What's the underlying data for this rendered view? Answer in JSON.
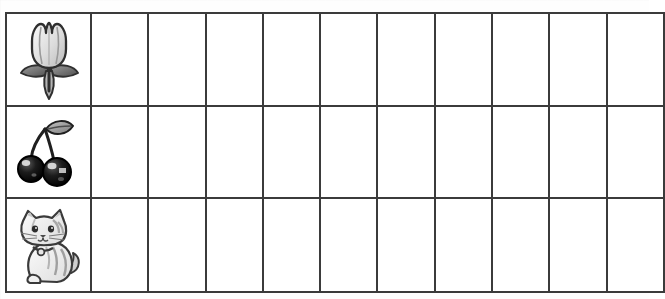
{
  "document": {
    "type": "worksheet-grid",
    "title": "Picture graph worksheet grid",
    "description": "Three-row table; first column holds a picture, remaining cells are blank.",
    "background_color": "#fefefe",
    "line_color": "#3b3b3b"
  },
  "grid": {
    "rows": 3,
    "columns": 11,
    "blank_columns": 10,
    "rows_data": [
      {
        "index": 1,
        "icon_name": "tulip-icon",
        "icon_label": "Tulip",
        "icon_colors": {
          "bloom": "#d9d9d9",
          "outline": "#2f2f2f",
          "leaf": "#8a8a8a",
          "leaf_dark": "#4a4a4a",
          "stem": "#7a7a7a"
        },
        "cells": [
          "",
          "",
          "",
          "",
          "",
          "",
          "",
          "",
          "",
          ""
        ]
      },
      {
        "index": 2,
        "icon_name": "cherries-icon",
        "icon_label": "Cherries",
        "icon_colors": {
          "fruit": "#141414",
          "highlight": "#e8e8e8",
          "outline": "#000000",
          "leaf": "#9a9a9a",
          "stem": "#2a2a2a"
        },
        "cells": [
          "",
          "",
          "",
          "",
          "",
          "",
          "",
          "",
          "",
          ""
        ]
      },
      {
        "index": 3,
        "icon_name": "cat-icon",
        "icon_label": "Cat",
        "icon_colors": {
          "body": "#f2f2f2",
          "stripes": "#9e9e9e",
          "outline": "#3a3a3a",
          "collar": "#cfcfcf"
        },
        "cells": [
          "",
          "",
          "",
          "",
          "",
          "",
          "",
          "",
          "",
          ""
        ]
      }
    ]
  }
}
